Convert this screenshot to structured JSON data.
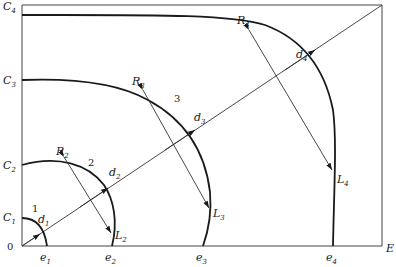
{
  "figure": {
    "type": "diagram",
    "origin_label": "0",
    "x_axis_end_label": "E",
    "y_axis_labels": [
      {
        "base": "C",
        "sub": "1"
      },
      {
        "base": "C",
        "sub": "2"
      },
      {
        "base": "C",
        "sub": "3"
      },
      {
        "base": "C",
        "sub": "4"
      }
    ],
    "x_axis_labels": [
      {
        "base": "e",
        "sub": "1"
      },
      {
        "base": "e",
        "sub": "2"
      },
      {
        "base": "e",
        "sub": "3"
      },
      {
        "base": "e",
        "sub": "4"
      }
    ],
    "curves": [
      {
        "number": "1",
        "d_label": {
          "base": "d",
          "sub": "1"
        }
      },
      {
        "number": "2",
        "d_label": {
          "base": "d",
          "sub": "2"
        },
        "R_label": {
          "base": "R",
          "sub": "2"
        },
        "L_label": {
          "base": "L",
          "sub": "2"
        }
      },
      {
        "number": "3",
        "d_label": {
          "base": "d",
          "sub": "3"
        },
        "R_label": {
          "base": "R",
          "sub": "3"
        },
        "L_label": {
          "base": "L",
          "sub": "3"
        }
      },
      {
        "number": "",
        "d_label": {
          "base": "d",
          "sub": "4"
        },
        "R_label": {
          "base": "R",
          "sub": "4"
        },
        "L_label": {
          "base": "L",
          "sub": "4"
        }
      }
    ]
  }
}
